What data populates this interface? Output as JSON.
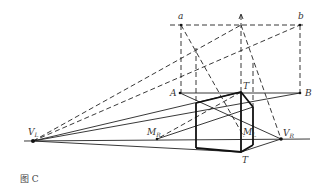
{
  "diagram": {
    "caption": "图 C",
    "labels": {
      "a": "a",
      "b": "b",
      "A": "A",
      "B": "B",
      "T_prime": "T",
      "T_prime_mark": "′",
      "T": "T",
      "VL": "V",
      "VL_sub": "L",
      "VR": "V",
      "VR_sub": "R",
      "MR": "M",
      "MR_sub": "R",
      "ML": "M",
      "ML_sub": "L"
    },
    "colors": {
      "line": "#222222",
      "label": "#333333",
      "background": "#ffffff"
    }
  }
}
